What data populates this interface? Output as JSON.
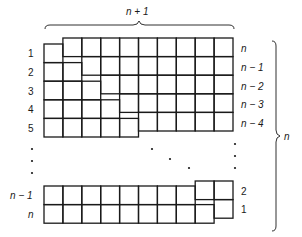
{
  "diagram": {
    "top_brace_label": "n + 1",
    "right_brace_label": "n",
    "left_labels": [
      "1",
      "2",
      "3",
      "4",
      "5",
      "n − 1",
      "n"
    ],
    "right_labels": [
      "n",
      "n − 1",
      "n − 2",
      "n − 3",
      "n − 4",
      "2",
      "1"
    ],
    "left_staircase_row_lengths": [
      1,
      2,
      3,
      4,
      5
    ],
    "right_staircase_row_lengths": [
      9,
      8,
      7,
      6,
      5
    ],
    "bottom_rows": {
      "n_minus_1_left": 8,
      "n_left": 9,
      "right_2": 2,
      "right_1": 1
    },
    "grid_width_cells": 10,
    "ellipsis": "•",
    "line_color": "#1a1a1a",
    "background_color": "#ffffff"
  }
}
